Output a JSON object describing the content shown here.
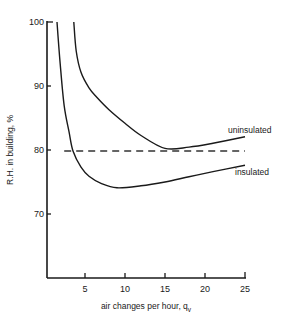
{
  "chart_data": {
    "type": "line",
    "title": "",
    "xlabel": "air changes per hour, q",
    "xlabel_subscript": "v",
    "ylabel": "R.H. in building, %",
    "xlim": [
      0,
      25
    ],
    "ylim": [
      60,
      100
    ],
    "x_ticks": [
      5,
      10,
      15,
      20,
      25
    ],
    "y_ticks": [
      70,
      80,
      90,
      100
    ],
    "x_tick_labels": [
      "5",
      "10",
      "15",
      "20",
      "25"
    ],
    "y_tick_labels": [
      "70",
      "80",
      "90",
      "100"
    ],
    "grid": false,
    "legend": "inline labels at curve ends",
    "reference_line": {
      "y": 80,
      "style": "dashed",
      "x_start": 2.4,
      "x_end": 25
    },
    "series": [
      {
        "name": "uninsulated",
        "x": [
          3.6,
          3.9,
          4.5,
          5.5,
          6.5,
          8,
          10,
          12,
          15,
          18,
          21,
          25
        ],
        "y": [
          100,
          95.5,
          92.2,
          89.8,
          88.3,
          86.4,
          84.3,
          82.4,
          80.4,
          80.6,
          81.2,
          82.2
        ]
      },
      {
        "name": "insulated",
        "x": [
          1.5,
          1.9,
          2.4,
          3.0,
          3.5,
          4.5,
          5.5,
          7,
          9,
          12,
          15,
          18,
          21,
          25
        ],
        "y": [
          100,
          93.5,
          87.0,
          83.0,
          80.0,
          77.5,
          76.1,
          75.0,
          74.3,
          74.6,
          75.2,
          76.0,
          76.8,
          77.8
        ]
      }
    ]
  },
  "labels": {
    "y_axis_title": "R.H. in building, %",
    "x_axis_title": "air changes per hour, q",
    "x_axis_subscript": "v",
    "series_uninsulated": "uninsulated",
    "series_insulated": "insulated",
    "y_ticks": [
      "100",
      "90",
      "80",
      "70"
    ],
    "x_ticks": [
      "5",
      "10",
      "15",
      "20",
      "25"
    ]
  }
}
